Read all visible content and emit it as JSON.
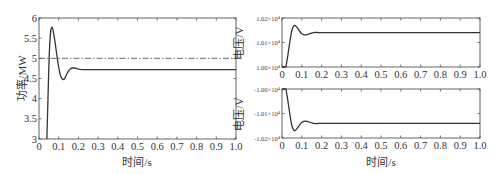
{
  "chart_data": [
    {
      "type": "line",
      "title": "",
      "xlabel": "时间/s",
      "ylabel": "功率/MW",
      "xlim": [
        0,
        1.0
      ],
      "ylim": [
        3,
        6
      ],
      "x_ticks": [
        "0",
        "0.1",
        "0.2",
        "0.3",
        "0.4",
        "0.5",
        "0.6",
        "0.7",
        "0.8",
        "0.9",
        "1.0"
      ],
      "y_ticks": [
        "3",
        "3.5",
        "4",
        "4.5",
        "5",
        "5.5",
        "6"
      ],
      "grid": false,
      "series": [
        {
          "name": "power",
          "style": "solid",
          "x": [
            0.04,
            0.045,
            0.05,
            0.055,
            0.06,
            0.065,
            0.07,
            0.08,
            0.09,
            0.1,
            0.11,
            0.12,
            0.13,
            0.14,
            0.15,
            0.16,
            0.17,
            0.18,
            0.19,
            0.2,
            0.22,
            0.25,
            0.3,
            0.5,
            1.0
          ],
          "values": [
            3.0,
            3.9,
            4.8,
            5.4,
            5.7,
            5.77,
            5.72,
            5.45,
            5.1,
            4.78,
            4.56,
            4.48,
            4.5,
            4.6,
            4.69,
            4.74,
            4.76,
            4.76,
            4.75,
            4.73,
            4.72,
            4.72,
            4.72,
            4.72,
            4.72
          ]
        },
        {
          "name": "reference",
          "style": "dash-dot",
          "x": [
            0,
            1.0
          ],
          "values": [
            5.0,
            5.0
          ]
        }
      ]
    },
    {
      "type": "line",
      "title": "",
      "xlabel": "",
      "ylabel": "电压/V",
      "xlim": [
        0,
        1.0
      ],
      "ylim": [
        10000,
        10200
      ],
      "x_ticks": [
        "0",
        "0.1",
        "0.2",
        "0.3",
        "0.4",
        "0.5",
        "0.6",
        "0.7",
        "0.8",
        "0.9",
        "1.0"
      ],
      "y_ticks": [
        "1.00×10⁴",
        "1.01×10⁴",
        "1.02×10⁴"
      ],
      "grid": false,
      "series": [
        {
          "name": "voltage_positive",
          "x": [
            0.02,
            0.03,
            0.04,
            0.05,
            0.06,
            0.065,
            0.07,
            0.08,
            0.09,
            0.1,
            0.11,
            0.12,
            0.13,
            0.15,
            0.17,
            0.18,
            0.2,
            0.25,
            1.0
          ],
          "values": [
            10000,
            10050,
            10105,
            10150,
            10168,
            10170,
            10167,
            10157,
            10145,
            10136,
            10132,
            10131,
            10133,
            10138,
            10141,
            10141,
            10140,
            10140,
            10140
          ]
        }
      ]
    },
    {
      "type": "line",
      "title": "",
      "xlabel": "时间/s",
      "ylabel": "电压/V",
      "xlim": [
        0,
        1.0
      ],
      "ylim": [
        -10200,
        -10000
      ],
      "x_ticks": [
        "0",
        "0.1",
        "0.2",
        "0.3",
        "0.4",
        "0.5",
        "0.6",
        "0.7",
        "0.8",
        "0.9",
        "1.0"
      ],
      "y_ticks": [
        "-1.00×10⁴",
        "-1.01×10⁴",
        "-1.02×10⁴"
      ],
      "grid": false,
      "series": [
        {
          "name": "voltage_negative",
          "x": [
            0.02,
            0.03,
            0.04,
            0.05,
            0.06,
            0.065,
            0.07,
            0.08,
            0.09,
            0.1,
            0.11,
            0.12,
            0.13,
            0.15,
            0.17,
            0.18,
            0.2,
            0.25,
            1.0
          ],
          "values": [
            -10000,
            -10050,
            -10105,
            -10150,
            -10168,
            -10170,
            -10167,
            -10157,
            -10145,
            -10136,
            -10132,
            -10131,
            -10133,
            -10138,
            -10141,
            -10141,
            -10140,
            -10140,
            -10140
          ]
        }
      ]
    }
  ],
  "labels": {
    "left_ylabel": "功率/MW",
    "left_xlabel": "时间/s",
    "right_top_ylabel": "电压/V",
    "right_bottom_ylabel": "电压/V",
    "right_xlabel": "时间/s"
  }
}
